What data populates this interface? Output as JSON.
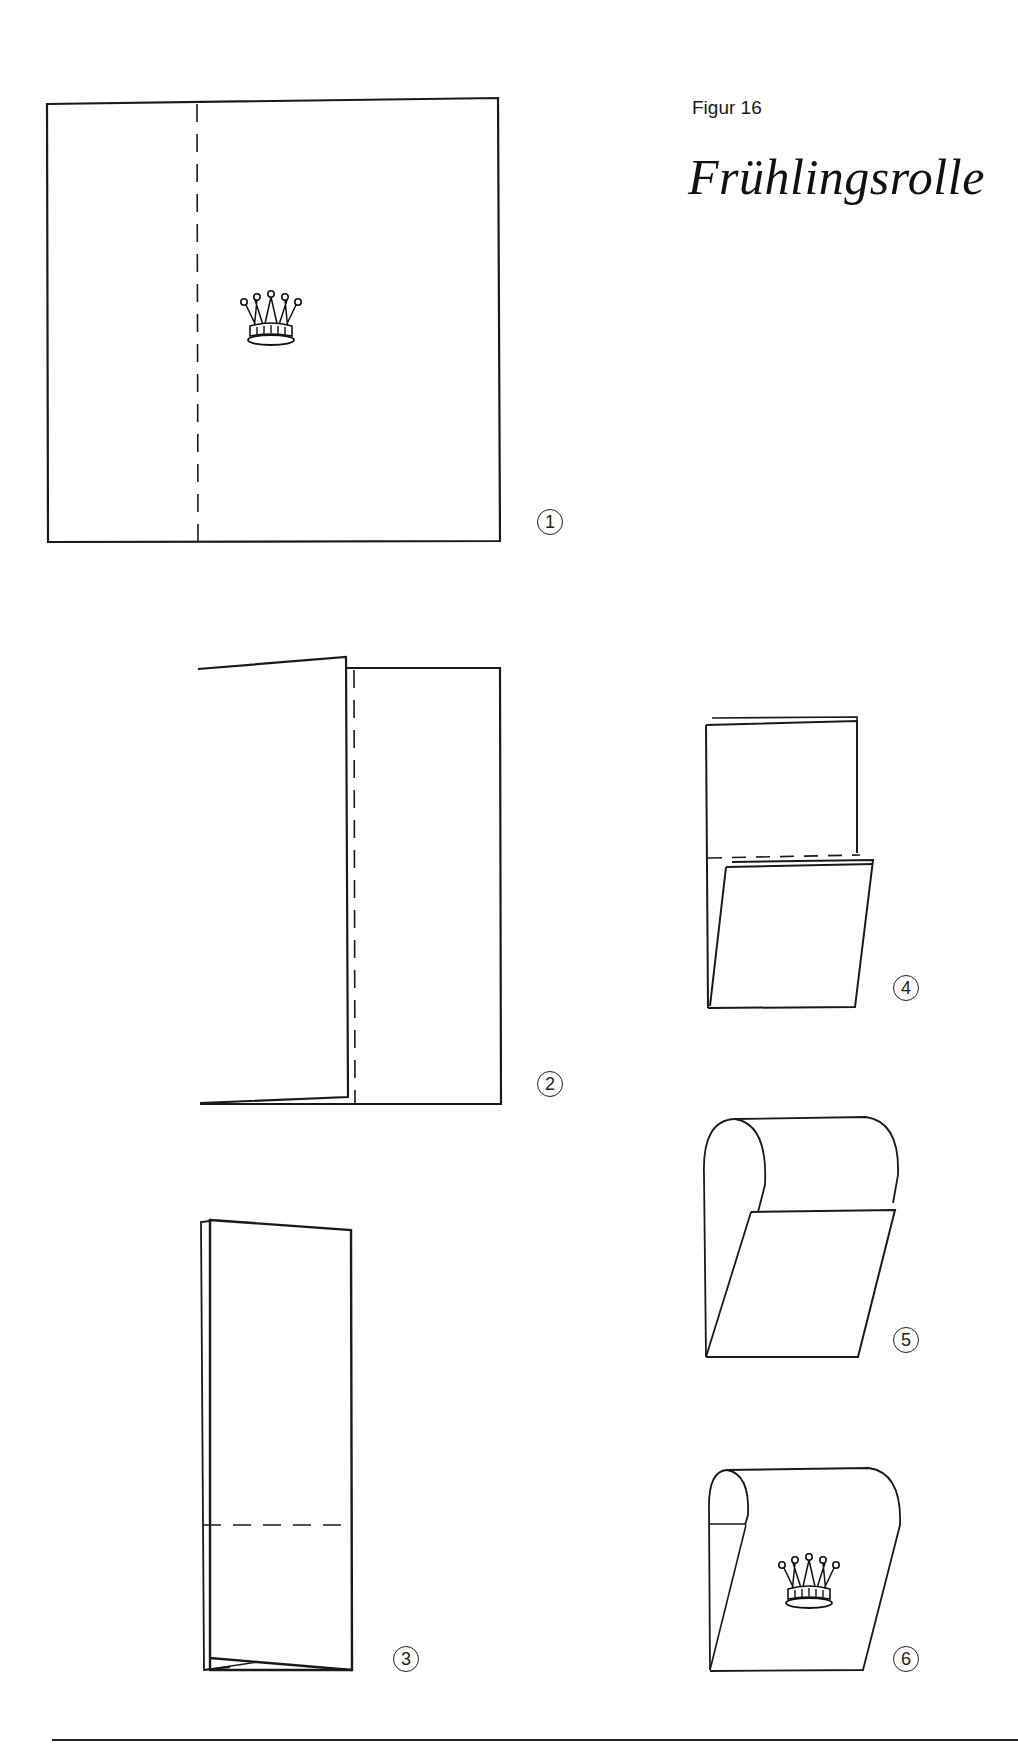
{
  "header": {
    "figure_label": "Figur 16",
    "title": "Frühlingsrolle"
  },
  "steps": [
    {
      "number": "①",
      "label": "1",
      "description": "Square napkin, crown motif in center, dashed fold line at left third"
    },
    {
      "number": "②",
      "label": "2",
      "description": "Left third folded in; dashed fold line near center"
    },
    {
      "number": "③",
      "label": "3",
      "description": "Folded into narrow strip; dashed horizontal fold line near bottom"
    },
    {
      "number": "④",
      "label": "4",
      "description": "Bottom folded up; dashed horizontal line"
    },
    {
      "number": "⑤",
      "label": "5",
      "description": "Top rolled over toward front"
    },
    {
      "number": "⑥",
      "label": "6",
      "description": "Finished spring roll with crown motif"
    }
  ],
  "icons": {
    "motif": "crown-icon"
  },
  "colors": {
    "line": "#1a1a1a",
    "background": "#ffffff"
  }
}
